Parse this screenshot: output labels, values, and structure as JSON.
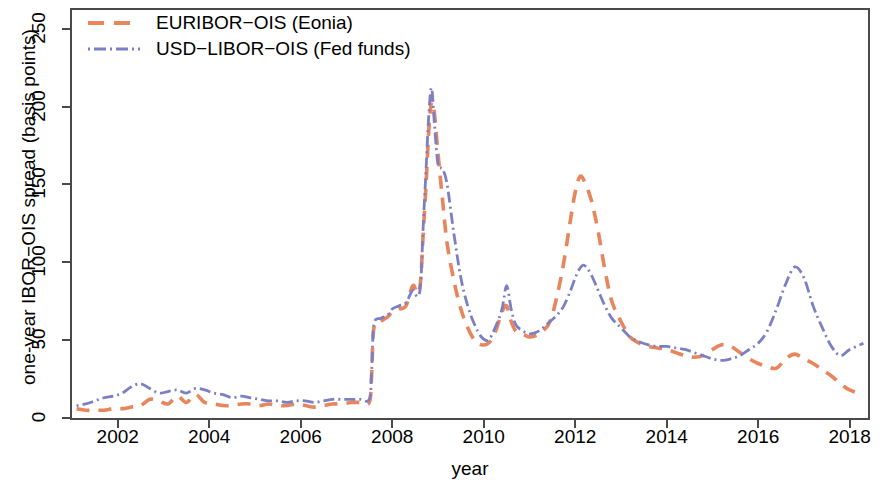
{
  "chart_data": {
    "type": "line",
    "title": "",
    "xlabel": "year",
    "ylabel": "one-year IBOR−OIS spread (basis points)",
    "xlim": [
      2001.0,
      2018.4
    ],
    "ylim": [
      0,
      262
    ],
    "xticks": [
      2002,
      2004,
      2006,
      2008,
      2010,
      2012,
      2014,
      2016,
      2018
    ],
    "yticks": [
      0,
      50,
      100,
      150,
      200,
      250
    ],
    "grid": false,
    "legend_position": "top-left",
    "series": [
      {
        "name": "EURIBOR−OIS (Eonia)",
        "color": "#E8855C",
        "dash": "dashed",
        "x": [
          2001.1,
          2001.3,
          2001.5,
          2001.7,
          2001.9,
          2002.1,
          2002.3,
          2002.5,
          2002.7,
          2002.9,
          2003.1,
          2003.3,
          2003.5,
          2003.7,
          2003.9,
          2004.1,
          2004.3,
          2004.5,
          2004.7,
          2004.9,
          2005.1,
          2005.3,
          2005.5,
          2005.7,
          2005.9,
          2006.1,
          2006.3,
          2006.5,
          2006.7,
          2006.9,
          2007.1,
          2007.3,
          2007.5,
          2007.55,
          2007.6,
          2007.75,
          2007.9,
          2008.0,
          2008.15,
          2008.3,
          2008.45,
          2008.55,
          2008.62,
          2008.68,
          2008.74,
          2008.8,
          2008.86,
          2008.92,
          2009.0,
          2009.1,
          2009.2,
          2009.35,
          2009.5,
          2009.65,
          2009.8,
          2009.95,
          2010.1,
          2010.25,
          2010.4,
          2010.5,
          2010.6,
          2010.7,
          2010.85,
          2011.0,
          2011.15,
          2011.3,
          2011.45,
          2011.6,
          2011.75,
          2011.9,
          2012.0,
          2012.1,
          2012.2,
          2012.35,
          2012.5,
          2012.65,
          2012.8,
          2013.0,
          2013.2,
          2013.4,
          2013.6,
          2013.8,
          2014.0,
          2014.2,
          2014.4,
          2014.6,
          2014.8,
          2015.0,
          2015.2,
          2015.4,
          2015.6,
          2015.8,
          2016.0,
          2016.2,
          2016.4,
          2016.6,
          2016.8,
          2017.0,
          2017.2,
          2017.4,
          2017.6,
          2017.8,
          2018.0,
          2018.3
        ],
        "y": [
          6,
          5,
          5,
          5,
          6,
          6,
          7,
          8,
          12,
          11,
          9,
          14,
          10,
          15,
          10,
          9,
          8,
          8,
          9,
          9,
          8,
          9,
          8,
          8,
          9,
          8,
          7,
          8,
          9,
          9,
          10,
          10,
          10,
          28,
          58,
          62,
          65,
          68,
          70,
          72,
          85,
          80,
          88,
          120,
          150,
          185,
          203,
          196,
          170,
          140,
          112,
          88,
          70,
          58,
          50,
          47,
          48,
          55,
          68,
          72,
          62,
          56,
          54,
          52,
          53,
          56,
          62,
          78,
          100,
          128,
          145,
          155,
          152,
          140,
          120,
          95,
          75,
          62,
          52,
          48,
          46,
          45,
          44,
          42,
          40,
          39,
          40,
          44,
          47,
          46,
          42,
          38,
          35,
          33,
          32,
          38,
          41,
          38,
          35,
          31,
          27,
          22,
          18,
          15
        ]
      },
      {
        "name": "USD−LIBOR−OIS (Fed funds)",
        "color": "#7B7FC4",
        "dash": "dash-dot",
        "x": [
          2001.1,
          2001.3,
          2001.5,
          2001.7,
          2001.9,
          2002.1,
          2002.3,
          2002.5,
          2002.7,
          2002.9,
          2003.1,
          2003.3,
          2003.5,
          2003.7,
          2003.9,
          2004.1,
          2004.3,
          2004.5,
          2004.7,
          2004.9,
          2005.1,
          2005.3,
          2005.5,
          2005.7,
          2005.9,
          2006.1,
          2006.3,
          2006.5,
          2006.7,
          2006.9,
          2007.1,
          2007.3,
          2007.5,
          2007.55,
          2007.6,
          2007.75,
          2007.9,
          2008.0,
          2008.15,
          2008.3,
          2008.45,
          2008.55,
          2008.62,
          2008.68,
          2008.74,
          2008.8,
          2008.86,
          2008.92,
          2009.0,
          2009.1,
          2009.2,
          2009.35,
          2009.5,
          2009.65,
          2009.8,
          2009.95,
          2010.1,
          2010.25,
          2010.4,
          2010.5,
          2010.6,
          2010.7,
          2010.85,
          2011.0,
          2011.15,
          2011.3,
          2011.45,
          2011.6,
          2011.75,
          2011.9,
          2012.0,
          2012.1,
          2012.2,
          2012.35,
          2012.5,
          2012.65,
          2012.8,
          2013.0,
          2013.2,
          2013.4,
          2013.6,
          2013.8,
          2014.0,
          2014.2,
          2014.4,
          2014.6,
          2014.8,
          2015.0,
          2015.2,
          2015.4,
          2015.6,
          2015.8,
          2016.0,
          2016.2,
          2016.4,
          2016.6,
          2016.8,
          2017.0,
          2017.2,
          2017.4,
          2017.6,
          2017.8,
          2018.0,
          2018.3
        ],
        "y": [
          8,
          9,
          11,
          13,
          14,
          16,
          20,
          22,
          19,
          16,
          17,
          18,
          16,
          19,
          18,
          16,
          15,
          13,
          14,
          13,
          12,
          11,
          11,
          10,
          11,
          11,
          10,
          11,
          12,
          12,
          12,
          12,
          12,
          30,
          60,
          64,
          66,
          70,
          72,
          74,
          82,
          78,
          86,
          125,
          160,
          195,
          212,
          190,
          163,
          160,
          150,
          118,
          90,
          72,
          60,
          52,
          50,
          58,
          70,
          85,
          70,
          60,
          56,
          54,
          55,
          58,
          62,
          66,
          72,
          82,
          90,
          96,
          98,
          92,
          82,
          72,
          64,
          58,
          52,
          49,
          47,
          46,
          46,
          45,
          44,
          42,
          40,
          38,
          37,
          38,
          40,
          44,
          48,
          56,
          70,
          86,
          97,
          90,
          72,
          58,
          46,
          40,
          44,
          48
        ]
      }
    ]
  },
  "legend": {
    "items": [
      {
        "label": "EURIBOR−OIS (Eonia)"
      },
      {
        "label": "USD−LIBOR−OIS (Fed funds)"
      }
    ]
  }
}
